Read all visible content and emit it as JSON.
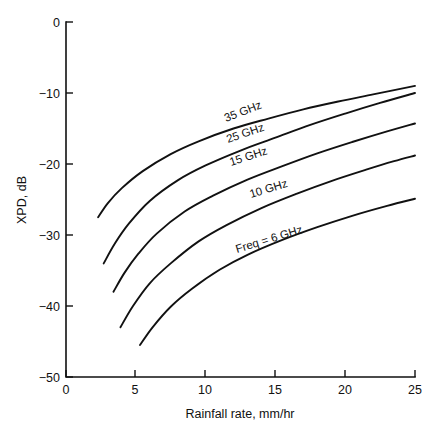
{
  "chart_data": {
    "type": "line",
    "title": "",
    "xlabel": "Rainfall rate, mm/hr",
    "ylabel": "XPD, dB",
    "xlim": [
      0,
      25
    ],
    "ylim": [
      -50,
      0
    ],
    "xticks": [
      "0",
      "5",
      "10",
      "15",
      "20",
      "25"
    ],
    "xtick_values": [
      0,
      5,
      10,
      15,
      20,
      25
    ],
    "yticks": [
      "0",
      "−10",
      "−20",
      "−30",
      "−40",
      "−50"
    ],
    "ytick_values": [
      0,
      -10,
      -20,
      -30,
      -40,
      -50
    ],
    "grid": false,
    "legend_position": "inline-along-curves",
    "series": [
      {
        "name": "35 GHz",
        "label": "35 GHz",
        "x": [
          2.7,
          3.5,
          4.5,
          6.0,
          8.0,
          10.0,
          12.5,
          15.0,
          17.5,
          20.0,
          22.5,
          25.0
        ],
        "values": [
          -34.0,
          -31.2,
          -28.4,
          -25.2,
          -22.3,
          -20.2,
          -18.1,
          -16.3,
          -14.5,
          -12.9,
          -11.4,
          -10.0
        ]
      },
      {
        "name": "25 GHz",
        "label": "25 GHz",
        "x": [
          3.4,
          4.2,
          5.2,
          6.5,
          8.5,
          10.5,
          13.0,
          15.5,
          18.0,
          20.5,
          23.0,
          25.0
        ],
        "values": [
          -38.0,
          -35.3,
          -32.6,
          -29.8,
          -26.7,
          -24.5,
          -22.2,
          -20.3,
          -18.5,
          -16.9,
          -15.4,
          -14.3
        ]
      },
      {
        "name": "15 GHz",
        "label": "15 GHz",
        "x": [
          3.9,
          4.8,
          6.0,
          7.5,
          9.5,
          11.5,
          14.0,
          16.5,
          19.0,
          21.5,
          23.5,
          25.0
        ],
        "values": [
          -43.0,
          -40.0,
          -36.8,
          -34.0,
          -30.9,
          -28.6,
          -26.2,
          -24.2,
          -22.4,
          -20.8,
          -19.6,
          -18.8
        ]
      },
      {
        "name": "10 GHz",
        "label": "10 GHz",
        "x": [
          5.3,
          6.2,
          7.5,
          9.0,
          11.0,
          13.0,
          15.5,
          18.0,
          20.5,
          23.0,
          25.0
        ],
        "values": [
          -45.5,
          -43.0,
          -40.1,
          -37.6,
          -34.9,
          -32.8,
          -30.7,
          -28.9,
          -27.3,
          -25.9,
          -24.9
        ]
      },
      {
        "name": "Freq = 6 GHz",
        "label": "Freq = 6 GHz",
        "x": [
          2.3,
          3.0,
          4.0,
          5.5,
          7.5,
          9.5,
          12.0,
          14.5,
          17.0,
          19.5,
          22.0,
          25.0
        ],
        "values": [
          -27.5,
          -25.5,
          -23.4,
          -21.0,
          -18.6,
          -16.8,
          -15.0,
          -13.6,
          -12.3,
          -11.2,
          -10.2,
          -9.0
        ]
      }
    ]
  },
  "axis": {
    "x_title": "Rainfall rate, mm/hr",
    "y_title": "XPD, dB",
    "x_tick_0": "0",
    "x_tick_1": "5",
    "x_tick_2": "10",
    "x_tick_3": "15",
    "x_tick_4": "20",
    "x_tick_5": "25",
    "y_tick_0": "0",
    "y_tick_1": "−10",
    "y_tick_2": "−20",
    "y_tick_3": "−30",
    "y_tick_4": "−40",
    "y_tick_5": "−50"
  },
  "labels": {
    "curve_35": "35 GHz",
    "curve_25": "25 GHz",
    "curve_15": "15 GHz",
    "curve_10": "10 GHz",
    "curve_6": "Freq = 6 GHz"
  },
  "colors": {
    "ink": "#111111",
    "background": "#ffffff"
  }
}
